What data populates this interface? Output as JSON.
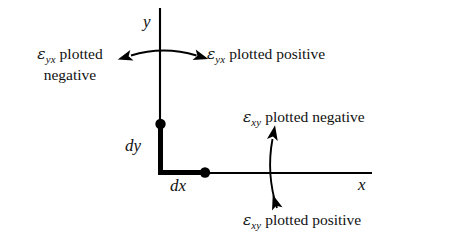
{
  "figure": {
    "type": "strain-sign-convention-diagram",
    "background_color": "#ffffff",
    "ink_color": "#000000"
  },
  "axes": {
    "y_label": "y",
    "x_label": "x",
    "origin_px": [
      160,
      173
    ],
    "y_axis_top_px": 8,
    "x_axis_right_px": 372
  },
  "element": {
    "dy_label": "dy",
    "dx_label": "dx",
    "corner_px": [
      160,
      173
    ],
    "vertical_dot_px": [
      160,
      124
    ],
    "horizontal_dot_px": [
      205,
      173
    ]
  },
  "annotations": {
    "top_left": {
      "line1_symbol": "ε",
      "line1_subscript": "yx",
      "line1_text": " plotted",
      "line2_text": "negative"
    },
    "top_right": {
      "symbol": "ε",
      "subscript": "yx",
      "text": " plotted positive"
    },
    "right_upper": {
      "symbol": "ε",
      "subscript": "xy",
      "text": " plotted negative"
    },
    "right_lower": {
      "symbol": "ε",
      "subscript": "xy",
      "text": " plotted positive"
    }
  },
  "arrows": {
    "horizontal_pair": {
      "name": "shear-arrow-horizontal",
      "left_tip_px": [
        127,
        55
      ],
      "right_tip_px": [
        200,
        55
      ],
      "crosses_axis": "y"
    },
    "vertical_pair": {
      "name": "shear-arrow-vertical",
      "top_tip_px": [
        272,
        134
      ],
      "bottom_tip_px": [
        278,
        212
      ],
      "crosses_axis": "x"
    }
  }
}
